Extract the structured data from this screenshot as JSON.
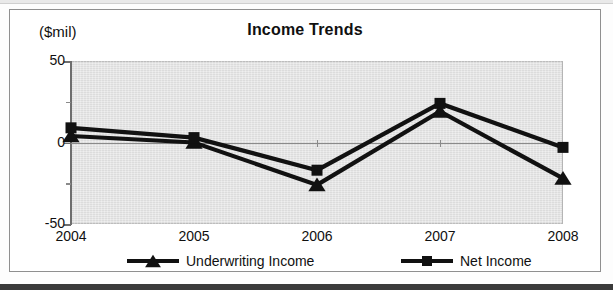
{
  "chart_data": {
    "type": "line",
    "title": "Income Trends",
    "xlabel": "",
    "ylabel": "($mil)",
    "unit_label": "($mil)",
    "categories": [
      "2004",
      "2005",
      "2006",
      "2007",
      "2008"
    ],
    "ylim": [
      -50,
      50
    ],
    "ytick_labels": [
      "50",
      "0",
      "-50"
    ],
    "ytick_values": [
      50,
      0,
      -50
    ],
    "minor_ytick_values": [
      25,
      -25
    ],
    "grid": false,
    "zero_line": true,
    "legend_position": "bottom",
    "plot_background": "#dcdcdc",
    "series": [
      {
        "name": "Underwriting Income",
        "marker": "triangle",
        "color": "#111111",
        "values": [
          4,
          0,
          -26,
          19,
          -22
        ]
      },
      {
        "name": "Net Income",
        "marker": "square",
        "color": "#111111",
        "values": [
          9,
          3,
          -17,
          24,
          -3
        ]
      }
    ]
  },
  "legend": {
    "items": [
      {
        "label": "Underwriting Income",
        "marker": "triangle-marker"
      },
      {
        "label": "Net Income",
        "marker": "square-marker"
      }
    ]
  },
  "colors": {
    "ink": "#111111",
    "plot_fill": "#dcdcdc",
    "axis": "#6e6e6e",
    "frame": "#8f8f8f"
  }
}
